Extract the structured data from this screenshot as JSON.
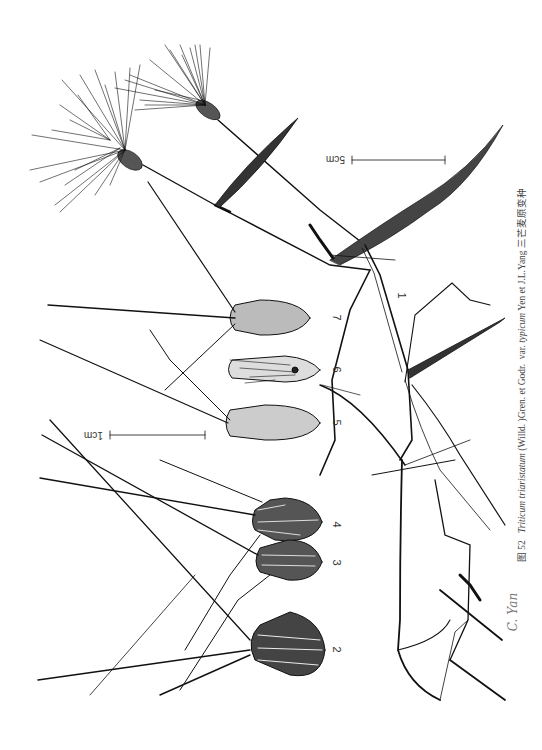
{
  "figure": {
    "number_label": "图 52",
    "caption_parts": {
      "species": "Triticum triaristatum",
      "author1": "(Willd. )Gren. et Godr.",
      "var_label": "var.",
      "variety": "typicum",
      "author2": "Yen et J.L.Yang",
      "chinese_name": "三芒麦原变种"
    },
    "signature": "C. Yan"
  },
  "labels": {
    "l1": "1",
    "l2": "2",
    "l3": "3",
    "l4": "4",
    "l5": "5",
    "l6": "6",
    "l7": "7"
  },
  "scale_bars": {
    "large": "5cm",
    "small": "1cm"
  },
  "colors": {
    "ink": "#111111",
    "background": "#ffffff",
    "caption": "#444444"
  }
}
